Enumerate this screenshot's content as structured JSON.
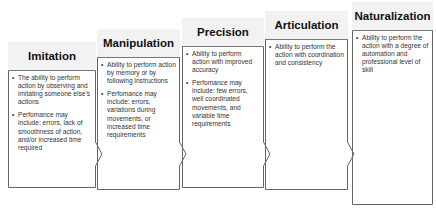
{
  "diagram": {
    "type": "staircase-stages",
    "stages": [
      {
        "title": "Imitation",
        "bullets": [
          "The ability to perform action by observing and imitating someone else's actions",
          "Perfomance may include: errors, lack of smoothness of action, and/or increased time required"
        ]
      },
      {
        "title": "Manipulation",
        "bullets": [
          "Ability to perform action by memory or by following instructions",
          "Perfomance may include: errors, variations during movements, or increased time requirements"
        ]
      },
      {
        "title": "Precision",
        "bullets": [
          "Ability to perform action with improved accuracy",
          "Perfomance may include: few errors, well coordinated movements, and variable time requirements"
        ]
      },
      {
        "title": "Articulation",
        "bullets": [
          "Ability to perform the action with coordination and consistency"
        ]
      },
      {
        "title": "Naturalization",
        "bullets": [
          "Ability to perform the action with a degree of automation and professional level of skill"
        ]
      }
    ]
  }
}
